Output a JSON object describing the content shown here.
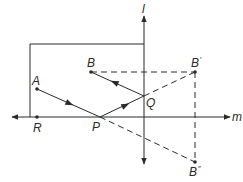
{
  "diagram": {
    "title": "",
    "stroke_color": "#2a2a2a",
    "lines": {
      "l": {
        "label": "l"
      },
      "m": {
        "label": "m"
      }
    },
    "points": {
      "A": {
        "label": "A"
      },
      "B": {
        "label": "B"
      },
      "B_prime": {
        "label": "B",
        "mark": "′"
      },
      "B_double_prime": {
        "label": "B",
        "mark": "″"
      },
      "P": {
        "label": "P"
      },
      "Q": {
        "label": "Q"
      },
      "R": {
        "label": "R"
      }
    },
    "segments": [
      {
        "from": "A",
        "to": "P",
        "style": "solid",
        "arrow": "toward P"
      },
      {
        "from": "P",
        "to": "Q",
        "style": "solid",
        "arrow": "toward Q"
      },
      {
        "from": "Q",
        "to": "B",
        "style": "solid",
        "arrow": "toward B"
      },
      {
        "from": "Q",
        "to": "B_prime",
        "style": "dashed"
      },
      {
        "from": "P",
        "to": "B_double_prime",
        "style": "dashed"
      },
      {
        "from": "B",
        "to": "B_prime",
        "style": "dashed"
      },
      {
        "from": "B_prime",
        "to": "B_double_prime",
        "style": "dashed"
      }
    ],
    "rectangle": {
      "description": "box bounded by line l and line m with corner above R"
    }
  }
}
